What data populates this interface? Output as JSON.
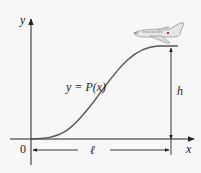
{
  "diagram": {
    "y_axis_label": "y",
    "x_axis_label": "x",
    "origin_label": "0",
    "curve_label": "y = P(x)",
    "height_label": "h",
    "length_label": "ℓ",
    "object": "airplane-icon"
  },
  "colors": {
    "background": "#f7f7f7",
    "axis": "#222222",
    "curve": "#555555",
    "plane_body": "#e6e6e6",
    "plane_outline": "#8a8a8a",
    "plane_windows": "#555555"
  }
}
